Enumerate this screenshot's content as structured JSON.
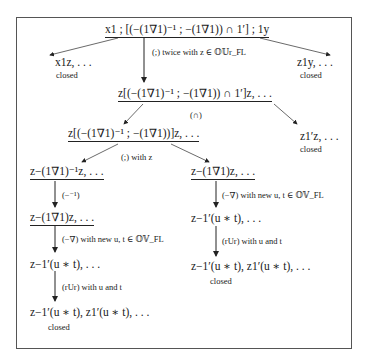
{
  "nodes": {
    "root": "x1 ; [(−(1∇1)⁻¹ ; −(1∇1)) ∩ 1′] ; 1y",
    "left_top": "x1z, . . .",
    "right_top": "z1y, . . .",
    "mid": "z[(−(1∇1)⁻¹ ; −(1∇1)) ∩ 1′]z, . . .",
    "mid_left": "z[(−(1∇1)⁻¹ ; −(1∇1))]z, . . .",
    "mid_right": "z1′z, . . .",
    "ll1": "z−(1∇1)⁻¹z, . . .",
    "ll2": "z−(1∇1)z, . . .",
    "ll3": "z−1′(u ∗ t), . . .",
    "ll4": "z−1′(u ∗ t), z1′(u ∗ t), . . .",
    "rl1": "z−(1∇1)z, . . .",
    "rl2": "z−1′(u ∗ t), . . .",
    "rl3": "z−1′(u ∗ t), z1′(u ∗ t), . . ."
  },
  "labels": {
    "twice": "(;) twice with z ∈ 𝕆𝕌r_FL",
    "cap": "(∩)",
    "semi_z": "(;) with z",
    "inv": "(−⁻¹)",
    "neg_nabla_left": "(−∇) with new u, t ∈ 𝕆𝕍_FL",
    "neg_nabla_right": "(−∇) with new u, t ∈ 𝕆𝕍_FL",
    "rur_left": "(rUr) with u and t",
    "rur_right": "(rUr) with u and t"
  },
  "closed": "closed"
}
